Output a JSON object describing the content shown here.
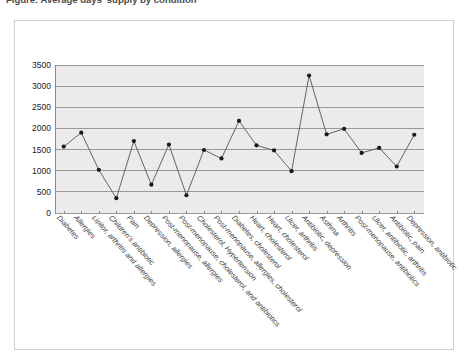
{
  "title": "Figure: Average days' supply by condition",
  "chart_data": {
    "type": "line",
    "title": "Figure: Average days' supply by condition",
    "xlabel": "",
    "ylabel": "",
    "ylim": [
      0,
      3500
    ],
    "ytick_step": 500,
    "yticks": [
      0,
      500,
      1000,
      1500,
      2000,
      2500,
      3000,
      3500
    ],
    "grid": true,
    "legend": "none",
    "marker": "filled-circle",
    "line_color": "#555555",
    "marker_color": "#1a1a1a",
    "plot_background": "#eceaea",
    "categories": [
      "Diabetes",
      "Allergies",
      "Lipitor, arthritis and allergies",
      "Children's antibiotic",
      "Pain",
      "Depression, allergies",
      "Post-menopause, allergies",
      "Post-menopause, cholesterol, and antibiotics",
      "Cholesterol, Hypertension",
      "Post-menopause, allergies, cholesterol",
      "Diabetes, cholesterol",
      "Heart, cholesterol",
      "Heart, cholesterol",
      "Ulcer, arthritis",
      "Antibiotic, depression",
      "Asthma",
      "Arthritis",
      "Post-menopause, antibiotics",
      "Ulcer, antibiotic, arthritis",
      "Antibiotic, pain",
      "Depression, antibiotic"
    ],
    "values": [
      1570,
      1900,
      1020,
      350,
      1700,
      670,
      1620,
      420,
      1490,
      1290,
      2180,
      1600,
      1480,
      990,
      3250,
      1860,
      1990,
      1420,
      1540,
      1100,
      1850
    ]
  }
}
